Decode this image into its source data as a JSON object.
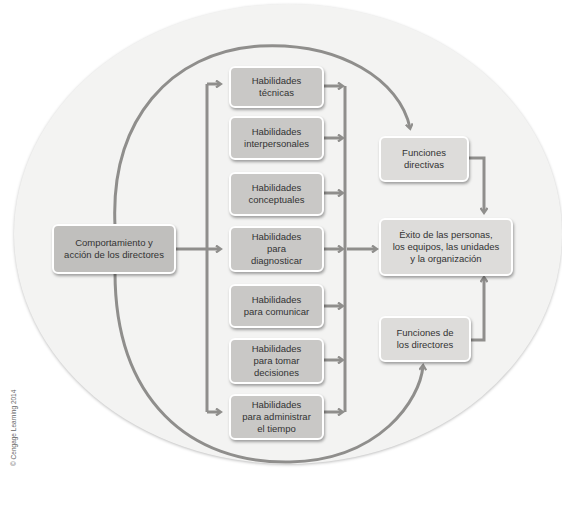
{
  "diagram": {
    "source_box": {
      "label": "Comportamiento y\nacción de los directores"
    },
    "skills": [
      {
        "label": "Habilidades\ntécnicas"
      },
      {
        "label": "Habilidades\ninterpersonales"
      },
      {
        "label": "Habilidades\nconceptuales"
      },
      {
        "label": "Habilidades\npara\ndiagnosticar"
      },
      {
        "label": "Habilidades\npara comunicar"
      },
      {
        "label": "Habilidades\npara tomar\ndecisiones"
      },
      {
        "label": "Habilidades\npara administrar\nel tiempo"
      }
    ],
    "functions_top": {
      "label": "Funciones\ndirectivas"
    },
    "functions_bottom": {
      "label": "Funciones de\nlos directores"
    },
    "outcome": {
      "label": "Éxito de las personas,\nlos equipos, las unidades\ny la organización"
    },
    "colors": {
      "box_fill": "#c9c8c6",
      "box_light": "#dddcda",
      "line": "#8f8e8c",
      "background_ellipse": "#f3f3f2"
    }
  },
  "footer": {
    "copyright": "© Cengage Learning 2014"
  }
}
